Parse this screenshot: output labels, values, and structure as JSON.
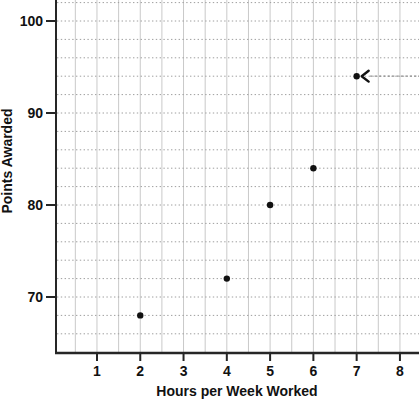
{
  "chart_data": {
    "type": "scatter",
    "title": "",
    "xlabel": "Hours per Week Worked",
    "ylabel": "Points Awarded",
    "x": [
      2,
      4,
      5,
      6,
      7
    ],
    "y": [
      68,
      72,
      80,
      84,
      94
    ],
    "x_ticks": [
      "1",
      "2",
      "3",
      "4",
      "5",
      "6",
      "7",
      "8"
    ],
    "x_tick_values": [
      1,
      2,
      3,
      4,
      5,
      6,
      7,
      8
    ],
    "y_ticks": [
      "70",
      "80",
      "90",
      "100"
    ],
    "y_tick_values": [
      70,
      80,
      90,
      100
    ],
    "xlim": [
      0,
      8.45
    ],
    "ylim": [
      63.9,
      102.3
    ],
    "x_grid_step": 0.5,
    "y_grid_step": 2,
    "grid": "on",
    "legend": "none",
    "annotation": {
      "type": "arrow",
      "points_to": {
        "x": 7,
        "y": 94
      },
      "from": "right-edge",
      "direction": "left"
    }
  },
  "colors": {
    "background": "#ffffff",
    "point": "#111111",
    "axis": "#262626",
    "text": "#111111",
    "grid_vertical": "#c9c9c9",
    "grid_horizontal": "#9e9e9e",
    "arrow_line": "#8f8f8f",
    "arrow_head": "#111111"
  }
}
